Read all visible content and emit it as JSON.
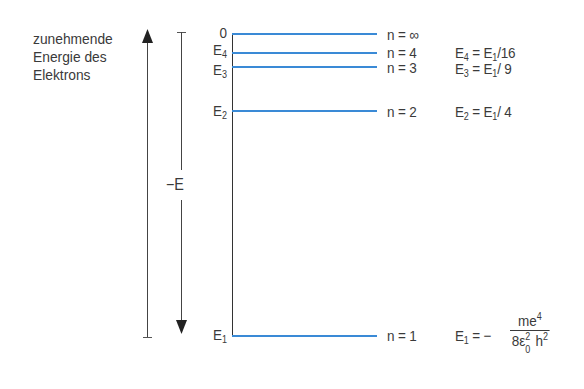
{
  "caption": {
    "lines": [
      "zunehmende",
      "Energie des",
      "Elektrons"
    ]
  },
  "axis": {
    "energy_label": "−E",
    "colors": {
      "level_line": "#3a8ad6",
      "axis_line": "#444444",
      "text": "#3a3a3a"
    }
  },
  "levels": [
    {
      "left_label": "0",
      "left_sub": "",
      "n_label": "n = ∞",
      "formula": ""
    },
    {
      "left_label": "E",
      "left_sub": "4",
      "n_label": "n = 4",
      "formula_lhs": "E",
      "formula_lhs_sub": "4",
      "formula_eq": " = E",
      "formula_rhs_sub": "1",
      "formula_tail": "/16"
    },
    {
      "left_label": "E",
      "left_sub": "3",
      "n_label": "n = 3",
      "formula_lhs": "E",
      "formula_lhs_sub": "3",
      "formula_eq": " = E",
      "formula_rhs_sub": "1",
      "formula_tail": "/ 9"
    },
    {
      "left_label": "E",
      "left_sub": "2",
      "n_label": "n = 2",
      "formula_lhs": "E",
      "formula_lhs_sub": "2",
      "formula_eq": " = E",
      "formula_rhs_sub": "1",
      "formula_tail": "/ 4"
    },
    {
      "left_label": "E",
      "left_sub": "1",
      "n_label": "n = 1",
      "formula_lhs": "E",
      "formula_lhs_sub": "1",
      "formula_eq": " = −",
      "fraction": {
        "num_base": "me",
        "num_sup": "4",
        "den_a": "8ε",
        "den_a_sup": "2",
        "den_a_sub": "0",
        "den_b": " h",
        "den_b_sup": "2"
      }
    }
  ]
}
